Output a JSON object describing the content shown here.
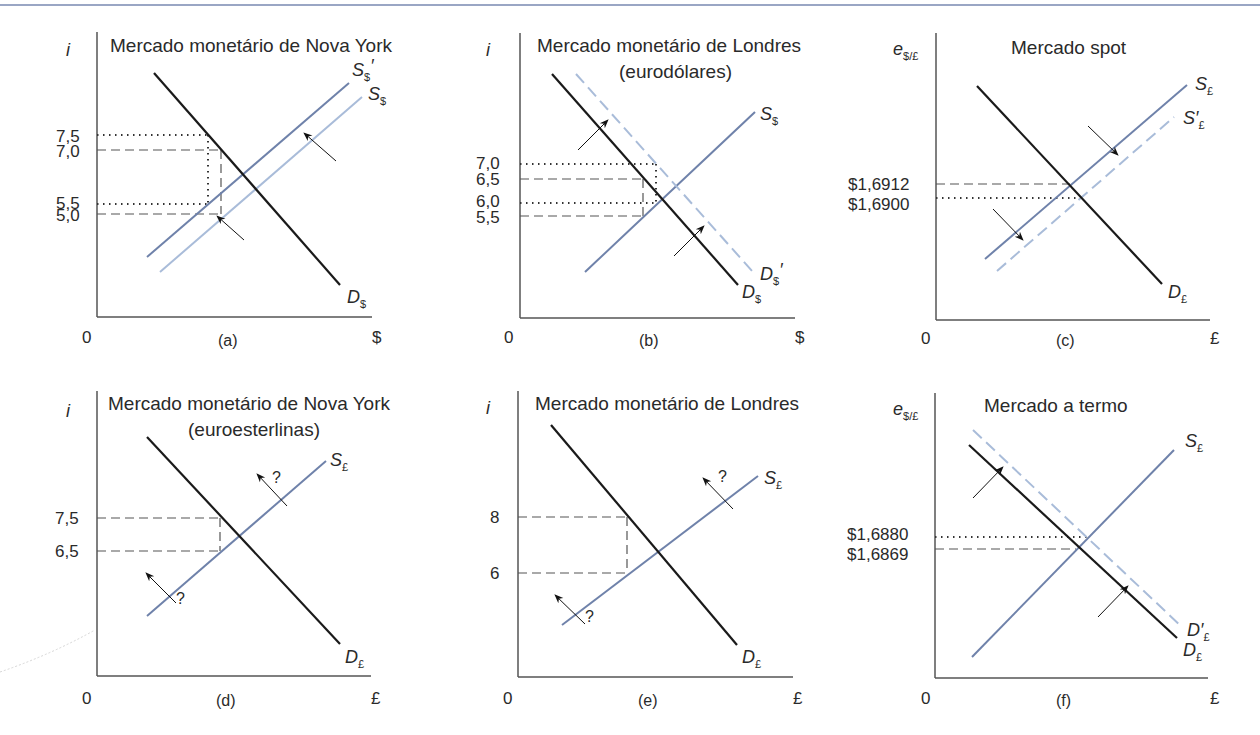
{
  "colors": {
    "demand": "#1a1a1a",
    "supply_dark": "#6f82aa",
    "supply_light": "#a9bcd9",
    "shifted_dashed": "#a9bcd9",
    "guide": "#444444",
    "border": "#9aa6c4"
  },
  "panels": [
    {
      "id": "a",
      "title": "Mercado monetário de Nova York",
      "subtitle": "",
      "caption": "(a)",
      "y_axis_label": "i",
      "y_axis_sub": "",
      "x_axis_label": "$",
      "origin_label": "0",
      "ticks": [
        "7,5",
        "7,0",
        "5,5",
        "5,0"
      ],
      "curves": {
        "c1": "S",
        "c1_sub": "$",
        "c1_prime": "′",
        "c2": "S",
        "c2_sub": "$",
        "c3": "D",
        "c3_sub": "$"
      }
    },
    {
      "id": "b",
      "title": "Mercado monetário de Londres",
      "subtitle": "(eurodólares)",
      "caption": "(b)",
      "y_axis_label": "i",
      "y_axis_sub": "",
      "x_axis_label": "$",
      "origin_label": "0",
      "ticks": [
        "7,0",
        "6,5",
        "6,0",
        "5,5"
      ],
      "curves": {
        "c1": "S",
        "c1_sub": "$",
        "c2": "D",
        "c2_sub": "$",
        "c2_prime": "′",
        "c3": "D",
        "c3_sub": "$"
      }
    },
    {
      "id": "c",
      "title": "Mercado spot",
      "subtitle": "",
      "caption": "(c)",
      "y_axis_label": "e",
      "y_axis_sub": "$/£",
      "x_axis_label": "£",
      "origin_label": "0",
      "ticks": [
        "$1,6912",
        "$1,6900"
      ],
      "curves": {
        "c1": "S",
        "c1_sub": "£",
        "c2": "S′",
        "c2_sub": "£",
        "c3": "D",
        "c3_sub": "£"
      }
    },
    {
      "id": "d",
      "title": "Mercado monetário de Nova York",
      "subtitle": "(euroesterlinas)",
      "caption": "(d)",
      "y_axis_label": "i",
      "y_axis_sub": "",
      "x_axis_label": "£",
      "origin_label": "0",
      "ticks": [
        "7,5",
        "6,5"
      ],
      "question_mark": "?",
      "curves": {
        "c1": "S",
        "c1_sub": "£",
        "c3": "D",
        "c3_sub": "£"
      }
    },
    {
      "id": "e",
      "title": "Mercado monetário de Londres",
      "subtitle": "",
      "caption": "(e)",
      "y_axis_label": "i",
      "y_axis_sub": "",
      "x_axis_label": "£",
      "origin_label": "0",
      "ticks": [
        "8",
        "6"
      ],
      "question_mark": "?",
      "curves": {
        "c1": "S",
        "c1_sub": "£",
        "c3": "D",
        "c3_sub": "£"
      }
    },
    {
      "id": "f",
      "title": "Mercado a termo",
      "subtitle": "",
      "caption": "(f)",
      "y_axis_label": "e",
      "y_axis_sub": "$/£",
      "x_axis_label": "£",
      "origin_label": "0",
      "ticks": [
        "$1,6880",
        "$1,6869"
      ],
      "curves": {
        "c1": "S",
        "c1_sub": "£",
        "c2": "D′",
        "c2_sub": "£",
        "c3": "D",
        "c3_sub": "£"
      }
    }
  ]
}
